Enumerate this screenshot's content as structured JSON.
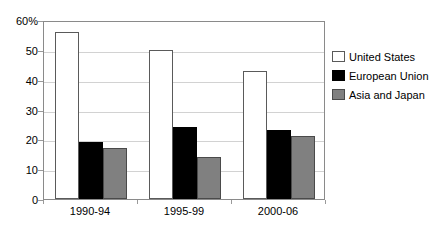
{
  "chart_data": {
    "type": "bar",
    "title": "",
    "subtitle": "",
    "xlabel": "",
    "ylabel": "",
    "categories": [
      "1990-94",
      "1995-99",
      "2000-06"
    ],
    "series": [
      {
        "name": "United States",
        "values": [
          56,
          50,
          43
        ],
        "color": "#ffffff",
        "border": "#5a5a5a"
      },
      {
        "name": "European Union",
        "values": [
          19,
          24,
          23
        ],
        "color": "#000000",
        "border": "#000000"
      },
      {
        "name": "Asia and Japan",
        "values": [
          17,
          14,
          21
        ],
        "color": "#808080",
        "border": "#4a4a4a"
      }
    ],
    "ylim": [
      0,
      60
    ],
    "yticks": [
      0,
      10,
      20,
      30,
      40,
      50,
      60
    ],
    "ytick_labels": [
      "0",
      "10",
      "20",
      "30",
      "40",
      "50",
      "60%"
    ],
    "grid": true,
    "legend_position": "right"
  },
  "legend": {
    "items": [
      {
        "label": "United States"
      },
      {
        "label": "European Union"
      },
      {
        "label": "Asia and Japan"
      }
    ]
  }
}
